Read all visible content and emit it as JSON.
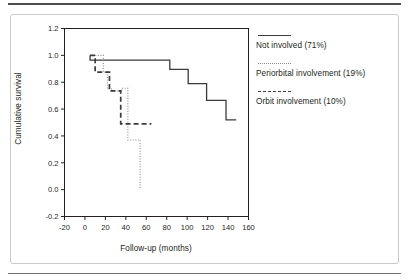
{
  "figure": {
    "background_color": "#ffffff",
    "border_color": "#c9cacc",
    "rule_color": "#4d4d4f"
  },
  "chart_data": {
    "type": "line",
    "title": "",
    "subtitle": "",
    "xlabel": "Follow-up (months)",
    "ylabel": "Cumulative survival",
    "xlim": [
      -20,
      160
    ],
    "ylim": [
      -0.2,
      1.2
    ],
    "xticks": [
      -20,
      0,
      20,
      40,
      60,
      80,
      100,
      120,
      140,
      160
    ],
    "yticks": [
      -0.2,
      0.0,
      0.2,
      0.4,
      0.6,
      0.8,
      1.0,
      1.2
    ],
    "xtick_labels": [
      "-20",
      "0",
      "20",
      "40",
      "60",
      "80",
      "100",
      "120",
      "140",
      "160"
    ],
    "ytick_labels": [
      "-0.2",
      "0.0",
      "0.2",
      "0.4",
      "0.6",
      "0.8",
      "1.0",
      "1.2"
    ],
    "grid": false,
    "legend_position": "right",
    "step_style": "post",
    "series": [
      {
        "name": "Not involved (71%)",
        "label": "Not involved (71%)",
        "style": "solid",
        "color": "#3b3b3d",
        "x": [
          5,
          5,
          9,
          83,
          83,
          101,
          101,
          119,
          119,
          138,
          138,
          148
        ],
        "y": [
          1.0,
          0.965,
          0.965,
          0.965,
          0.895,
          0.895,
          0.79,
          0.79,
          0.665,
          0.665,
          0.52,
          0.52
        ]
      },
      {
        "name": "Periorbital involvement (19%)",
        "label": "Periorbital involvement (19%)",
        "style": "dotted",
        "color": "#8b8b8d",
        "x": [
          5,
          18,
          18,
          22,
          22,
          26,
          26,
          36,
          36,
          42,
          42,
          54,
          54
        ],
        "y": [
          1.0,
          1.0,
          0.875,
          0.875,
          0.75,
          0.75,
          0.735,
          0.735,
          0.755,
          0.755,
          0.37,
          0.37,
          0.0
        ]
      },
      {
        "name": "Orbit involvement (10%)",
        "label": "Orbit involvement (10%)",
        "style": "dashed",
        "color": "#3b3b3d",
        "x": [
          5,
          10,
          10,
          24,
          24,
          35,
          35,
          65
        ],
        "y": [
          1.0,
          1.0,
          0.875,
          0.875,
          0.735,
          0.735,
          0.49,
          0.49
        ]
      }
    ]
  },
  "legend": {
    "entries": [
      {
        "label": "Not involved (71%)",
        "style": "solid"
      },
      {
        "label": "Periorbital involvement (19%)",
        "style": "dotted"
      },
      {
        "label": "Orbit involvement (10%)",
        "style": "dashed"
      }
    ]
  }
}
